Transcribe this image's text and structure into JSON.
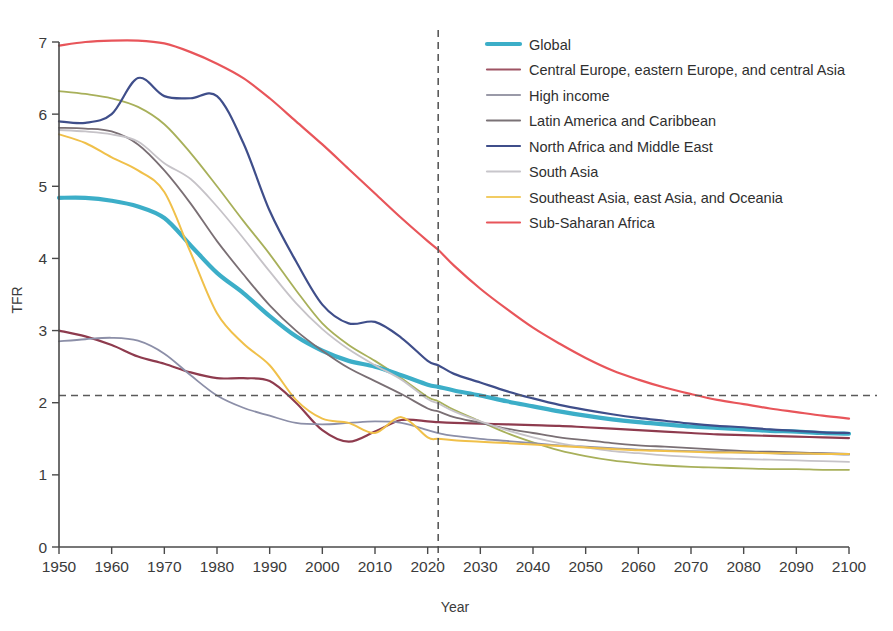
{
  "chart_data": {
    "type": "line",
    "title": "",
    "xlabel": "Year",
    "ylabel": "TFR",
    "xlim": [
      1950,
      2100
    ],
    "ylim": [
      0,
      7
    ],
    "grid": false,
    "legend_position": "top-right",
    "x_ticks": [
      1950,
      1960,
      1970,
      1980,
      1990,
      2000,
      2010,
      2020,
      2030,
      2040,
      2050,
      2060,
      2070,
      2080,
      2090,
      2100
    ],
    "y_ticks": [
      0,
      1,
      2,
      3,
      4,
      5,
      6,
      7
    ],
    "annotations": [
      {
        "name": "replacement-level-line",
        "type": "hline",
        "value": 2.1,
        "style": "dashed"
      },
      {
        "name": "forecast-start-line",
        "type": "vline",
        "value": 2022,
        "style": "dashed"
      }
    ],
    "x": [
      1950,
      1955,
      1960,
      1965,
      1970,
      1975,
      1980,
      1985,
      1990,
      1995,
      2000,
      2005,
      2010,
      2015,
      2020,
      2022,
      2025,
      2030,
      2035,
      2040,
      2045,
      2050,
      2055,
      2060,
      2065,
      2070,
      2075,
      2080,
      2085,
      2090,
      2095,
      2100
    ],
    "series": [
      {
        "name": "Global",
        "color": "#3caec8",
        "width": 4.2,
        "values": [
          4.84,
          4.84,
          4.8,
          4.72,
          4.56,
          4.18,
          3.8,
          3.52,
          3.2,
          2.92,
          2.72,
          2.58,
          2.5,
          2.38,
          2.25,
          2.22,
          2.17,
          2.1,
          2.02,
          1.95,
          1.88,
          1.82,
          1.77,
          1.73,
          1.7,
          1.67,
          1.65,
          1.63,
          1.61,
          1.6,
          1.58,
          1.57
        ]
      },
      {
        "name": "Central Europe, eastern Europe, and central Asia",
        "color": "#8e3b4e",
        "width": 2.2,
        "values": [
          3.0,
          2.92,
          2.8,
          2.64,
          2.54,
          2.42,
          2.34,
          2.34,
          2.3,
          2.0,
          1.62,
          1.46,
          1.6,
          1.76,
          1.74,
          1.73,
          1.72,
          1.71,
          1.7,
          1.69,
          1.68,
          1.66,
          1.64,
          1.62,
          1.6,
          1.58,
          1.56,
          1.55,
          1.54,
          1.53,
          1.52,
          1.51
        ]
      },
      {
        "name": "High income",
        "color": "#8c8fa8",
        "width": 1.8,
        "values": [
          2.85,
          2.88,
          2.9,
          2.86,
          2.68,
          2.38,
          2.1,
          1.93,
          1.82,
          1.72,
          1.7,
          1.72,
          1.74,
          1.72,
          1.62,
          1.58,
          1.54,
          1.5,
          1.47,
          1.44,
          1.41,
          1.39,
          1.37,
          1.35,
          1.34,
          1.33,
          1.32,
          1.31,
          1.3,
          1.29,
          1.29,
          1.28
        ]
      },
      {
        "name": "Latin America and Caribbean",
        "color": "#7a6f74",
        "width": 1.8,
        "values": [
          5.81,
          5.8,
          5.76,
          5.58,
          5.22,
          4.76,
          4.24,
          3.78,
          3.35,
          3.0,
          2.72,
          2.48,
          2.3,
          2.12,
          1.92,
          1.88,
          1.8,
          1.72,
          1.64,
          1.58,
          1.52,
          1.48,
          1.44,
          1.41,
          1.39,
          1.37,
          1.35,
          1.33,
          1.32,
          1.31,
          1.3,
          1.29
        ]
      },
      {
        "name": "North Africa and Middle East",
        "color": "#3f4e8a",
        "width": 2.2,
        "values": [
          5.9,
          5.88,
          6.0,
          6.5,
          6.25,
          6.22,
          6.25,
          5.6,
          4.66,
          3.96,
          3.36,
          3.1,
          3.12,
          2.9,
          2.58,
          2.52,
          2.4,
          2.28,
          2.16,
          2.06,
          1.97,
          1.9,
          1.84,
          1.79,
          1.75,
          1.71,
          1.68,
          1.66,
          1.63,
          1.61,
          1.59,
          1.58
        ]
      },
      {
        "name": "South Asia",
        "color": "#c6c3c8",
        "width": 1.8,
        "values": [
          5.78,
          5.76,
          5.72,
          5.62,
          5.32,
          5.1,
          4.72,
          4.28,
          3.82,
          3.38,
          3.02,
          2.74,
          2.52,
          2.32,
          2.05,
          1.99,
          1.88,
          1.74,
          1.62,
          1.52,
          1.44,
          1.38,
          1.33,
          1.3,
          1.27,
          1.25,
          1.23,
          1.22,
          1.21,
          1.2,
          1.19,
          1.18
        ]
      },
      {
        "name": "Southeast Asia, east Asia, and Oceania",
        "color": "#f0c04a",
        "width": 2.0,
        "values": [
          5.72,
          5.6,
          5.4,
          5.22,
          4.92,
          4.08,
          3.24,
          2.82,
          2.52,
          2.04,
          1.78,
          1.72,
          1.58,
          1.8,
          1.52,
          1.5,
          1.48,
          1.46,
          1.44,
          1.42,
          1.4,
          1.38,
          1.36,
          1.34,
          1.33,
          1.32,
          1.31,
          1.31,
          1.3,
          1.3,
          1.29,
          1.29
        ]
      },
      {
        "name": "Sub-Saharan Africa",
        "color": "#e8555a",
        "width": 2.2,
        "values": [
          6.95,
          7.0,
          7.02,
          7.02,
          6.98,
          6.86,
          6.7,
          6.5,
          6.22,
          5.9,
          5.58,
          5.24,
          4.9,
          4.56,
          4.24,
          4.12,
          3.9,
          3.58,
          3.3,
          3.04,
          2.82,
          2.62,
          2.45,
          2.32,
          2.21,
          2.12,
          2.04,
          1.98,
          1.92,
          1.87,
          1.82,
          1.78
        ]
      }
    ],
    "extra_series": [
      {
        "name": "unlabelled-olive-line",
        "color": "#a8b05a",
        "width": 1.8,
        "values": [
          6.32,
          6.28,
          6.22,
          6.1,
          5.86,
          5.46,
          5.0,
          4.52,
          4.06,
          3.56,
          3.1,
          2.8,
          2.58,
          2.34,
          2.08,
          2.02,
          1.9,
          1.74,
          1.58,
          1.45,
          1.34,
          1.26,
          1.2,
          1.16,
          1.13,
          1.11,
          1.1,
          1.09,
          1.08,
          1.08,
          1.07,
          1.07
        ]
      }
    ]
  },
  "legend": {
    "items": [
      {
        "label": "Global",
        "color": "#3caec8"
      },
      {
        "label": "Central Europe, eastern Europe, and central Asia",
        "color": "#9e5363"
      },
      {
        "label": "High income",
        "color": "#9a9aa8"
      },
      {
        "label": "Latin America and Caribbean",
        "color": "#7a7276"
      },
      {
        "label": "North Africa and Middle East",
        "color": "#3f4e8a"
      },
      {
        "label": "South Asia",
        "color": "#c8c6cb"
      },
      {
        "label": "Southeast Asia, east Asia, and Oceania",
        "color": "#f2cc63"
      },
      {
        "label": "Sub-Saharan Africa",
        "color": "#e8555a"
      }
    ]
  },
  "axes": {
    "y_title": "TFR",
    "x_title": "Year",
    "y_tick_labels": [
      "0",
      "1",
      "2",
      "3",
      "4",
      "5",
      "6",
      "7"
    ],
    "x_tick_labels": [
      "1950",
      "1960",
      "1970",
      "1980",
      "1990",
      "2000",
      "2010",
      "2020",
      "2030",
      "2040",
      "2050",
      "2060",
      "2070",
      "2080",
      "2090",
      "2100"
    ]
  }
}
